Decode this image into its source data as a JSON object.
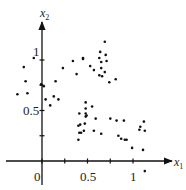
{
  "chart_data": {
    "type": "scatter",
    "title": "",
    "xlabel": "x1",
    "ylabel": "x2",
    "x_tick_labels": [
      "0",
      "0.5",
      "1"
    ],
    "y_tick_labels": [
      "0.5",
      "1"
    ],
    "x_ticks": [
      0,
      0.25,
      0.5,
      0.75,
      1
    ],
    "y_ticks": [
      0.25,
      0.5,
      0.75,
      1
    ],
    "xlim": [
      -0.4,
      1.3
    ],
    "ylim": [
      -0.25,
      1.55
    ],
    "grid": false,
    "legend": null,
    "series": [
      {
        "name": "points",
        "color": "#111111",
        "points": [
          [
            -0.09,
            1.02
          ],
          [
            -0.2,
            0.93
          ],
          [
            -0.18,
            0.79
          ],
          [
            -0.27,
            0.66
          ],
          [
            -0.16,
            0.67
          ],
          [
            -0.01,
            0.76
          ],
          [
            0.02,
            0.74
          ],
          [
            0.15,
            0.79
          ],
          [
            0.13,
            0.64
          ],
          [
            0.18,
            0.61
          ],
          [
            0.04,
            0.61
          ],
          [
            0.09,
            0.55
          ],
          [
            0.34,
            0.99
          ],
          [
            0.23,
            0.92
          ],
          [
            0.38,
            0.86
          ],
          [
            0.69,
            1.18
          ],
          [
            0.64,
            1.08
          ],
          [
            0.7,
            1.05
          ],
          [
            0.63,
            1.02
          ],
          [
            0.71,
            0.99
          ],
          [
            0.65,
            0.98
          ],
          [
            0.45,
            1.02
          ],
          [
            0.45,
            1.01
          ],
          [
            0.53,
            0.94
          ],
          [
            0.57,
            0.9
          ],
          [
            0.65,
            0.92
          ],
          [
            0.69,
            0.88
          ],
          [
            0.63,
            0.85
          ],
          [
            0.66,
            0.84
          ],
          [
            0.74,
            0.78
          ],
          [
            0.81,
            0.81
          ],
          [
            0.48,
            0.58
          ],
          [
            0.55,
            0.54
          ],
          [
            0.48,
            0.52
          ],
          [
            0.48,
            0.47
          ],
          [
            0.49,
            0.45
          ],
          [
            0.48,
            0.44
          ],
          [
            0.41,
            0.47
          ],
          [
            0.59,
            0.42
          ],
          [
            0.75,
            0.42
          ],
          [
            0.4,
            0.35
          ],
          [
            0.42,
            0.36
          ],
          [
            0.47,
            0.37
          ],
          [
            0.46,
            0.3
          ],
          [
            0.57,
            0.3
          ],
          [
            0.41,
            0.28
          ],
          [
            0.43,
            0.28
          ],
          [
            0.65,
            0.27
          ],
          [
            0.4,
            0.21
          ],
          [
            0.82,
            0.4
          ],
          [
            0.9,
            0.4
          ],
          [
            1.12,
            0.39
          ],
          [
            1.08,
            0.34
          ],
          [
            1.07,
            0.31
          ],
          [
            1.13,
            0.3
          ],
          [
            0.84,
            0.25
          ],
          [
            0.87,
            0.22
          ],
          [
            0.91,
            0.21
          ],
          [
            0.93,
            0.21
          ],
          [
            0.99,
            0.13
          ],
          [
            1.11,
            0.11
          ],
          [
            1.13,
            -0.1
          ]
        ]
      }
    ],
    "pixel_map": {
      "x0_px": 42,
      "x_unit_px": 91,
      "y0_px": 161,
      "y_unit_px": 101
    }
  }
}
